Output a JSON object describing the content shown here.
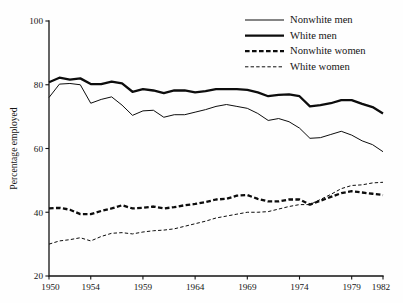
{
  "chart_data": {
    "type": "line",
    "title": "",
    "subtitle": "",
    "xlabel": "",
    "ylabel": "Percentage employed",
    "xlim": [
      1950,
      1982
    ],
    "ylim": [
      20,
      100
    ],
    "grid": false,
    "legend_position": "top-right",
    "x": [
      1950,
      1951,
      1952,
      1953,
      1954,
      1955,
      1956,
      1957,
      1958,
      1959,
      1960,
      1961,
      1962,
      1963,
      1964,
      1965,
      1966,
      1967,
      1968,
      1969,
      1970,
      1971,
      1972,
      1973,
      1974,
      1975,
      1976,
      1977,
      1978,
      1979,
      1980,
      1981,
      1982
    ],
    "x_tick_values": [
      1950,
      1954,
      1959,
      1964,
      1969,
      1974,
      1979,
      1982
    ],
    "x_tick_labels": [
      "1950",
      "1954",
      "1959",
      "1964",
      "1969",
      "1974",
      "1979",
      "1982"
    ],
    "y_tick_values": [
      20,
      40,
      60,
      80,
      100
    ],
    "y_tick_labels": [
      "20",
      "40",
      "60",
      "80",
      "100"
    ],
    "series": [
      {
        "name": "Nonwhite men",
        "style": "solid",
        "width": 1.0,
        "color": "#0d0d0d",
        "values": [
          76.0,
          80.2,
          80.4,
          80.0,
          74.2,
          75.4,
          76.2,
          73.6,
          70.4,
          71.8,
          72.0,
          69.8,
          70.6,
          70.6,
          71.4,
          72.2,
          73.2,
          73.8,
          73.2,
          72.6,
          71.0,
          68.8,
          69.4,
          68.4,
          66.4,
          63.2,
          63.4,
          64.4,
          65.4,
          64.2,
          62.4,
          61.2,
          59.0
        ]
      },
      {
        "name": "White men",
        "style": "solid",
        "width": 2.3,
        "color": "#0d0d0d",
        "values": [
          80.8,
          82.2,
          81.6,
          82.0,
          80.2,
          80.2,
          81.0,
          80.4,
          77.8,
          78.6,
          78.2,
          77.4,
          78.2,
          78.2,
          77.6,
          78.0,
          78.6,
          78.6,
          78.6,
          78.4,
          77.6,
          76.4,
          76.8,
          77.0,
          76.4,
          73.2,
          73.6,
          74.2,
          75.2,
          75.2,
          74.0,
          73.0,
          71.0
        ]
      },
      {
        "name": "Nonwhite women",
        "style": "dashed-thick",
        "width": 2.3,
        "color": "#0d0d0d",
        "values": [
          41.2,
          41.4,
          40.8,
          39.4,
          39.4,
          40.4,
          41.2,
          42.2,
          41.2,
          41.4,
          41.8,
          41.2,
          41.6,
          42.2,
          42.6,
          43.2,
          44.0,
          44.2,
          45.2,
          45.4,
          44.2,
          43.4,
          43.4,
          44.0,
          44.0,
          42.4,
          43.6,
          44.8,
          46.0,
          46.6,
          46.2,
          45.8,
          45.4
        ]
      },
      {
        "name": "White women",
        "style": "dashed-thin",
        "width": 1.0,
        "color": "#0d0d0d",
        "values": [
          30.0,
          31.0,
          31.4,
          32.0,
          31.0,
          32.4,
          33.4,
          33.6,
          33.2,
          33.8,
          34.2,
          34.4,
          34.8,
          35.6,
          36.4,
          37.2,
          38.2,
          38.8,
          39.4,
          40.0,
          40.0,
          40.2,
          41.0,
          41.8,
          42.4,
          42.4,
          44.0,
          45.6,
          47.4,
          48.4,
          48.6,
          49.2,
          49.4
        ]
      }
    ]
  },
  "legend": {
    "entries": [
      {
        "label": "Nonwhite men"
      },
      {
        "label": "White men"
      },
      {
        "label": "Nonwhite women"
      },
      {
        "label": "White women"
      }
    ]
  }
}
